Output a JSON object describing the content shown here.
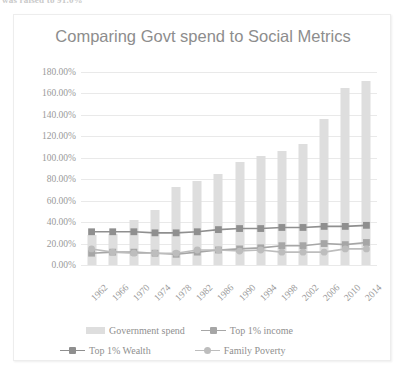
{
  "page": {
    "clipped_top_text": "was raised to 91.0%"
  },
  "chart": {
    "title": "Comparing Govt spend to Social Metrics"
  },
  "legend": {
    "position": "bottom",
    "rows": [
      [
        {
          "label": "Government spend",
          "marker": "bar",
          "color": "#dedede"
        },
        {
          "label": "Top 1% income",
          "marker": "square",
          "color": "#a6a6a6"
        }
      ],
      [
        {
          "label": "Top 1% Wealth",
          "marker": "square",
          "color": "#8f8f8f"
        },
        {
          "label": "Family Poverty",
          "marker": "circle",
          "color": "#bdbdbd"
        }
      ]
    ]
  },
  "chart_data": {
    "type": "bar",
    "title": "Comparing Govt spend to Social Metrics",
    "xlabel": "",
    "ylabel": "",
    "ylim": [
      0,
      180
    ],
    "ytick_labels": [
      "0.00%",
      "20.00%",
      "40.00%",
      "60.00%",
      "80.00%",
      "100.00%",
      "120.00%",
      "140.00%",
      "160.00%",
      "180.00%"
    ],
    "ytick_values": [
      0,
      20,
      40,
      60,
      80,
      100,
      120,
      140,
      160,
      180
    ],
    "grid": true,
    "categories": [
      "1962",
      "1966",
      "1970",
      "1974",
      "1978",
      "1982",
      "1986",
      "1990",
      "1994",
      "1998",
      "2002",
      "2006",
      "2010",
      "2014"
    ],
    "series": [
      {
        "name": "Government spend",
        "type": "bar",
        "color": "#dedede",
        "values": [
          28,
          29,
          42,
          51,
          73,
          78,
          85,
          96,
          102,
          106,
          113,
          136,
          165,
          172
        ]
      },
      {
        "name": "Top 1% income",
        "type": "line",
        "marker": "square",
        "color": "#a6a6a6",
        "values": [
          11,
          12,
          12,
          11,
          10,
          12,
          14,
          15,
          16,
          18,
          18,
          20,
          19,
          21
        ]
      },
      {
        "name": "Top 1% Wealth",
        "type": "line",
        "marker": "square",
        "color": "#8f8f8f",
        "values": [
          31,
          31,
          31,
          30,
          30,
          31,
          33,
          34,
          34,
          35,
          35,
          36,
          36,
          37
        ]
      },
      {
        "name": "Family Poverty",
        "type": "line",
        "marker": "circle",
        "color": "#bdbdbd",
        "values": [
          15,
          12,
          11,
          11,
          11,
          14,
          14,
          13,
          14,
          12,
          12,
          12,
          15,
          15
        ]
      }
    ]
  }
}
